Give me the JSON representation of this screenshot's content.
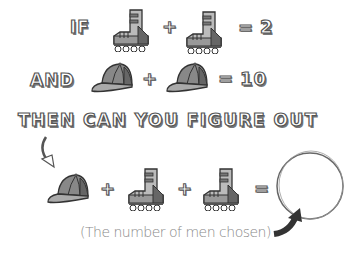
{
  "line1": {
    "if": "IF",
    "plus": "+",
    "equals": "=",
    "result": "2"
  },
  "line2": {
    "and": "AND",
    "plus": "+",
    "equals": "=",
    "result": "10"
  },
  "line3": {
    "text": "THEN CAN YOU FIGURE OUT"
  },
  "line4": {
    "plus1": "+",
    "plus2": "+",
    "equals": "="
  },
  "caption": "(The number of men chosen)",
  "icons": [
    "rollerskate-icon",
    "cap-icon",
    "curved-arrow-icon",
    "answer-circle"
  ],
  "colors": {
    "ink": "#444444",
    "dark": "#555555",
    "mid": "#888888",
    "light": "#bbbbbb"
  }
}
